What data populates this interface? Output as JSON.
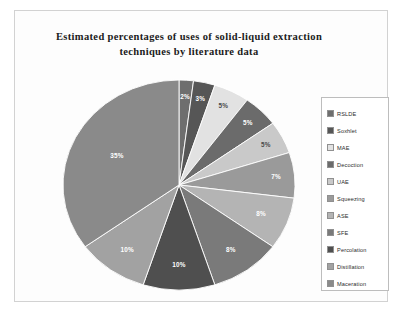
{
  "figure": {
    "title": "Estimated percentages of uses of solid-liquid  extraction techniques by literature data"
  },
  "chart_data": {
    "type": "pie",
    "title": "Estimated percentages of uses of solid-liquid extraction techniques by literature data",
    "xlabel": "",
    "ylabel": "",
    "legend_position": "right",
    "grid": false,
    "units": "percent",
    "total": 100,
    "categories": [
      "RSLDE",
      "Soxhlet",
      "MAE",
      "Decoction",
      "UAE",
      "Squeezing",
      "ASE",
      "SFE",
      "Percolation",
      "Distillation",
      "Maceration"
    ],
    "values": [
      2,
      3,
      5,
      5,
      5,
      7,
      8,
      10,
      10,
      10,
      35
    ],
    "colors": [
      "#6e6e6e",
      "#565656",
      "#e2e2e2",
      "#6b6b6b",
      "#c9c9c9",
      "#9a9a9a",
      "#b4b4b4",
      "#7a7a7a",
      "#4f4f4f",
      "#a2a2a2",
      "#8a8a8a"
    ],
    "slices": [
      {
        "label": "RSLDE",
        "value": 2,
        "display": "2%",
        "color": "#6e6e6e"
      },
      {
        "label": "Soxhlet",
        "value": 3,
        "display": "3%",
        "color": "#565656"
      },
      {
        "label": "MAE",
        "value": 5,
        "display": "5%",
        "color": "#e2e2e2"
      },
      {
        "label": "Decoction",
        "value": 5,
        "display": "5%",
        "color": "#6b6b6b"
      },
      {
        "label": "UAE",
        "value": 5,
        "display": "5%",
        "color": "#c9c9c9"
      },
      {
        "label": "Squeezing",
        "value": 7,
        "display": "7%",
        "color": "#9a9a9a"
      },
      {
        "label": "ASE",
        "value": 8,
        "display": "8%",
        "color": "#b4b4b4"
      },
      {
        "label": "SFE",
        "value": 10,
        "display": "8%",
        "color": "#7a7a7a"
      },
      {
        "label": "Percolation",
        "value": 10,
        "display": "10%",
        "color": "#4f4f4f"
      },
      {
        "label": "Distillation",
        "value": 10,
        "display": "10%",
        "color": "#a2a2a2"
      },
      {
        "label": "Maceration",
        "value": 35,
        "display": "35%",
        "color": "#8a8a8a"
      }
    ]
  },
  "legend": {
    "items": [
      {
        "label": "RSLDE",
        "color": "#6e6e6e"
      },
      {
        "label": "Soxhlet",
        "color": "#565656"
      },
      {
        "label": "MAE",
        "color": "#e2e2e2"
      },
      {
        "label": "Decoction",
        "color": "#6b6b6b"
      },
      {
        "label": "UAE",
        "color": "#c9c9c9"
      },
      {
        "label": "Squeezing",
        "color": "#9a9a9a"
      },
      {
        "label": "ASE",
        "color": "#b4b4b4"
      },
      {
        "label": "SFE",
        "color": "#7a7a7a"
      },
      {
        "label": "Percolation",
        "color": "#4f4f4f"
      },
      {
        "label": "Distillation",
        "color": "#a2a2a2"
      },
      {
        "label": "Maceration",
        "color": "#8a8a8a"
      }
    ]
  }
}
